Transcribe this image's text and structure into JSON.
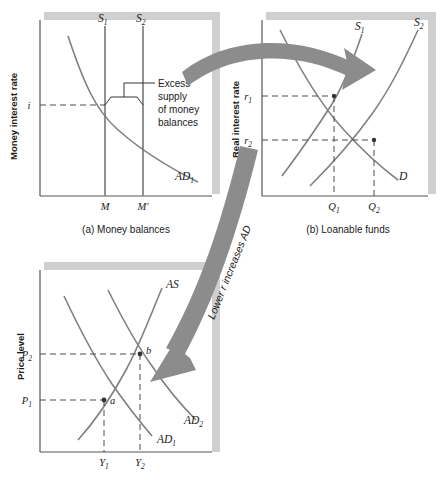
{
  "panel_a": {
    "caption": "(a) Money balances",
    "y_axis_label": "Money interest rate",
    "curves": [
      {
        "name": "S1",
        "label_main": "S",
        "label_sub": "1"
      },
      {
        "name": "S2",
        "label_main": "S",
        "label_sub": "2"
      },
      {
        "name": "AD1",
        "label_main": "AD",
        "label_sub": "1"
      }
    ],
    "y_ticks": [
      {
        "label_main": "i",
        "label_sub": ""
      }
    ],
    "x_ticks": [
      {
        "label_main": "M",
        "label_sub": ""
      },
      {
        "label_main": "M′",
        "label_sub": ""
      }
    ],
    "annotation": {
      "name": "excess-supply-note",
      "lines": [
        "Excess",
        "supply",
        "of money",
        "balances"
      ]
    }
  },
  "panel_b": {
    "caption": "(b) Loanable funds",
    "y_axis_label": "Real interest rate",
    "curves": [
      {
        "name": "S1",
        "label_main": "S",
        "label_sub": "1"
      },
      {
        "name": "S2",
        "label_main": "S",
        "label_sub": "2"
      },
      {
        "name": "D",
        "label_main": "D",
        "label_sub": ""
      }
    ],
    "y_ticks": [
      {
        "label_main": "r",
        "label_sub": "1"
      },
      {
        "label_main": "r",
        "label_sub": "2"
      }
    ],
    "x_ticks": [
      {
        "label_main": "Q",
        "label_sub": "1"
      },
      {
        "label_main": "Q",
        "label_sub": "2"
      }
    ]
  },
  "panel_c": {
    "caption": "",
    "y_axis_label": "Price level",
    "curves": [
      {
        "name": "AS",
        "label_main": "AS",
        "label_sub": ""
      },
      {
        "name": "AD1",
        "label_main": "AD",
        "label_sub": "1"
      },
      {
        "name": "AD2",
        "label_main": "AD",
        "label_sub": "2"
      }
    ],
    "y_ticks": [
      {
        "label_main": "P",
        "label_sub": "2"
      },
      {
        "label_main": "P",
        "label_sub": "1"
      }
    ],
    "x_ticks": [
      {
        "label_main": "Y",
        "label_sub": "1"
      },
      {
        "label_main": "Y",
        "label_sub": "2"
      }
    ],
    "points": [
      {
        "name": "a",
        "label": "a"
      },
      {
        "name": "b",
        "label": "b"
      }
    ]
  },
  "arrows": [
    {
      "name": "money-to-loanable-arrow",
      "label": ""
    },
    {
      "name": "loanable-to-ad-arrow",
      "label": "Lower r increases AD"
    }
  ],
  "colors": {
    "curve": "#808080",
    "axis": "#555555",
    "arrow_fill": "#8c8c8c",
    "panel_shadow": "#cfcfcf",
    "panel_border": "#6e6e6e",
    "text": "#1a1a1a",
    "dashed": "#4d4d4d"
  }
}
